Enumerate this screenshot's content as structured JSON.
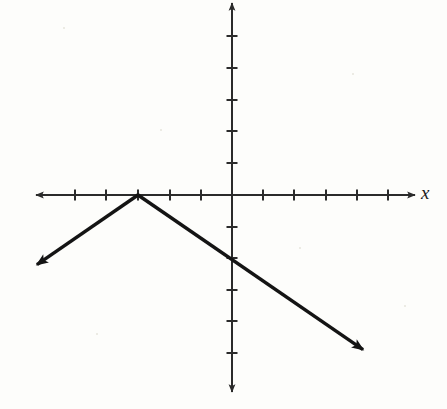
{
  "figure": {
    "background_color": "#fdfdfb",
    "ink_color": "#1a1a1a",
    "width": 447,
    "height": 409
  },
  "axes": {
    "x_label": "x",
    "y_label": "",
    "origin_px": {
      "x": 232,
      "y": 195
    },
    "unit_px": 31.4,
    "x_axis": {
      "name": "x-axis",
      "start_px": {
        "x": 36,
        "y": 195
      },
      "end_px": {
        "x": 415,
        "y": 195
      },
      "arrow_both_ends": true,
      "tick_length_px": 11,
      "tick_values": [
        -6,
        -5,
        -4,
        -3,
        -2,
        -1,
        1,
        2,
        3,
        4,
        5
      ],
      "tick_labels": []
    },
    "y_axis": {
      "name": "y-axis",
      "start_px": {
        "x": 232,
        "y": 3
      },
      "end_px": {
        "x": 232,
        "y": 392
      },
      "arrow_both_ends": true,
      "tick_length_px": 11,
      "tick_values": [
        6,
        5,
        4,
        3,
        2,
        1,
        -1,
        -2,
        -3,
        -4,
        -5,
        -6
      ],
      "tick_labels": []
    },
    "grid": false,
    "legend": false
  },
  "chart_data": {
    "type": "line",
    "title": "",
    "subtitle": "",
    "xlabel": "x",
    "ylabel": "",
    "xlim": [
      -6.2,
      5.8
    ],
    "ylim": [
      -6.2,
      6.1
    ],
    "grid": false,
    "legend_position": "none",
    "annotations": [],
    "series": [
      {
        "name": "inverted-absolute-value",
        "equation": "y = -(2/3)|x + 3|",
        "vertex": {
          "x": -3,
          "y": 0
        },
        "style": "solid",
        "stroke_width_px": 3.2,
        "color": "#141414",
        "arrows": [
          "start",
          "end"
        ],
        "points": [
          {
            "x": -6.4,
            "y": -2.3
          },
          {
            "x": -3,
            "y": 0
          },
          {
            "x": 0,
            "y": -2
          },
          {
            "x": 4.33,
            "y": -5.03
          }
        ],
        "segments": [
          {
            "name": "left-branch",
            "from_px": {
              "x": 32,
              "y": 268
            },
            "to_px": {
              "x": 138,
              "y": 195
            },
            "slope": 0.6667,
            "arrow_end": "from"
          },
          {
            "name": "right-branch",
            "from_px": {
              "x": 138,
              "y": 195
            },
            "to_px": {
              "x": 368,
              "y": 353
            },
            "slope": -0.6667,
            "arrow_end": "to"
          }
        ]
      }
    ]
  }
}
